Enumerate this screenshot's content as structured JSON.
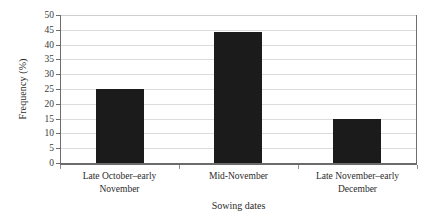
{
  "chart_data": {
    "type": "bar",
    "title": "",
    "subtitle": "",
    "xlabel": "Sowing dates",
    "ylabel": "Frequency (%)",
    "categories": [
      "Late October–early November",
      "Mid-November",
      "Late November–early December"
    ],
    "values": [
      25,
      44.3,
      15
    ],
    "ylim": [
      0,
      50
    ],
    "yticks": [
      0,
      5,
      10,
      15,
      20,
      25,
      30,
      35,
      40,
      45,
      50
    ],
    "ytick_labels": [
      "0",
      "5",
      "10",
      "15",
      "20",
      "25",
      "30",
      "35",
      "40",
      "45",
      "50"
    ],
    "grid": true,
    "grid_axis": "y",
    "legend": false,
    "legend_position": "none",
    "bar_color": "#1b1b1b",
    "grid_color": "#dcdcdc",
    "axis_color": "#6b6b6b",
    "text_color": "#2b2b2b",
    "background": "#ffffff",
    "annotations": []
  }
}
